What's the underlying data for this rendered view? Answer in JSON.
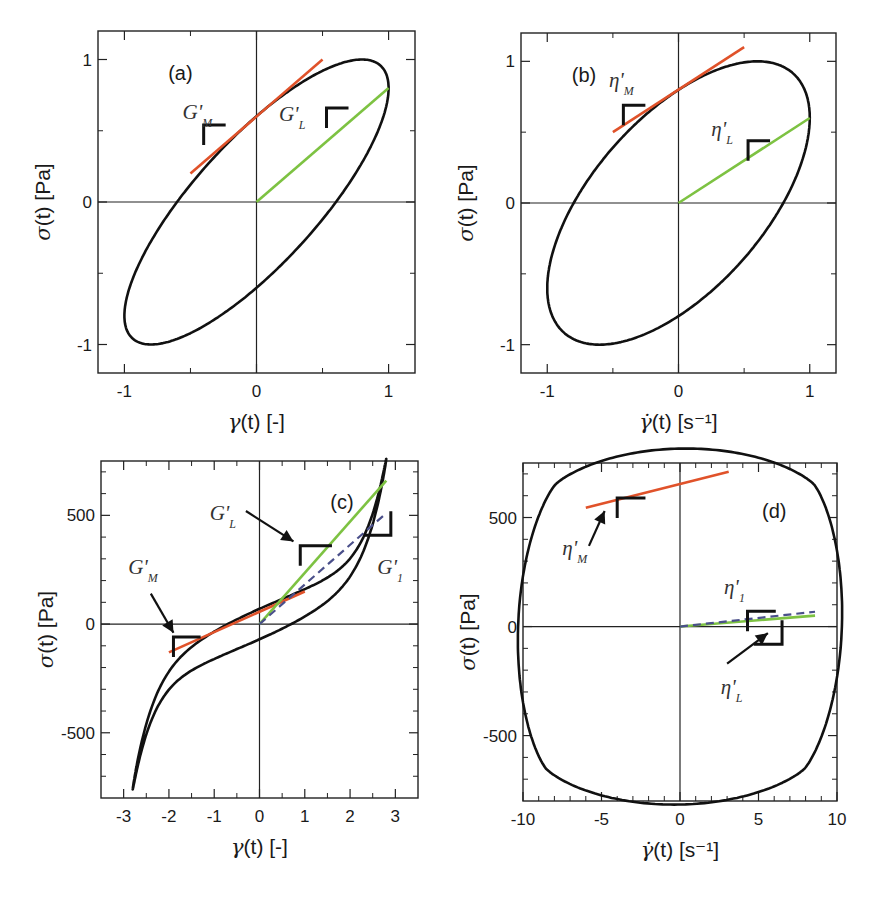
{
  "colors": {
    "curve": "#111111",
    "max_tangent": "#e0522a",
    "secant": "#7dc242",
    "dashed": "#4a4f8a",
    "axes": "#222222"
  },
  "chart_data": [
    {
      "id": "a",
      "type": "line",
      "panel_tag": "(a)",
      "title": "",
      "xlabel": {
        "symbol": "γ",
        "text": "(t)",
        "unit": "[-]"
      },
      "ylabel": {
        "symbol": "σ",
        "text": "(t)",
        "unit": "[Pa]"
      },
      "xlim": [
        -1.2,
        1.2
      ],
      "ylim": [
        -1.2,
        1.2
      ],
      "xticks_major": [
        -1,
        0,
        1
      ],
      "xticks_labels": [
        "-1",
        "0",
        "1"
      ],
      "xticks_minor": [
        -0.5,
        0.5
      ],
      "yticks_major": [
        -1,
        0,
        1
      ],
      "yticks_labels": [
        "-1",
        "0",
        "1"
      ],
      "yticks_minor": [
        -0.5,
        0.5
      ],
      "curve": {
        "shape": "ellipse",
        "strain_amplitude": 1.0,
        "stress_amplitude": 1.0,
        "phase_shift_deg": 37
      },
      "lines": [
        {
          "name": "G'_M tangent",
          "color_key": "max_tangent",
          "x": [
            -0.5,
            0.5
          ],
          "y": [
            0.2,
            1.0
          ]
        },
        {
          "name": "G'_L secant",
          "color_key": "secant",
          "x": [
            0,
            1.0
          ],
          "y": [
            0,
            0.8
          ]
        }
      ],
      "annotations": [
        {
          "main": "G'",
          "sub": "M",
          "x": -0.56,
          "y": 0.58
        },
        {
          "main": "G'",
          "sub": "L",
          "x": 0.17,
          "y": 0.57
        }
      ],
      "slope_markers": [
        {
          "x": -0.4,
          "y": 0.54
        },
        {
          "x": 0.53,
          "y": 0.66
        }
      ]
    },
    {
      "id": "b",
      "type": "line",
      "panel_tag": "(b)",
      "title": "",
      "xlabel": {
        "symbol": "γ̇",
        "text": "(t)",
        "unit": "[s⁻¹]"
      },
      "ylabel": {
        "symbol": "σ",
        "text": "(t)",
        "unit": "[Pa]"
      },
      "xlim": [
        -1.2,
        1.2
      ],
      "ylim": [
        -1.2,
        1.2
      ],
      "xticks_major": [
        -1,
        0,
        1
      ],
      "xticks_labels": [
        "-1",
        "0",
        "1"
      ],
      "xticks_minor": [
        -0.5,
        0.5
      ],
      "yticks_major": [
        -1,
        0,
        1
      ],
      "yticks_labels": [
        "-1",
        "0",
        "1"
      ],
      "yticks_minor": [
        -0.5,
        0.5
      ],
      "curve": {
        "shape": "ellipse",
        "rate_amplitude": 1.0,
        "stress_amplitude": 1.0,
        "phase_shift_deg": 53
      },
      "lines": [
        {
          "name": "η'_M tangent",
          "color_key": "max_tangent",
          "x": [
            -0.5,
            0.5
          ],
          "y": [
            0.5,
            1.1
          ]
        },
        {
          "name": "η'_L secant",
          "color_key": "secant",
          "x": [
            0,
            1.0
          ],
          "y": [
            0,
            0.6
          ]
        }
      ],
      "annotations": [
        {
          "main": "η'",
          "sub": "M",
          "x": -0.53,
          "y": 0.82
        },
        {
          "main": "η'",
          "sub": "L",
          "x": 0.25,
          "y": 0.47
        }
      ],
      "slope_markers": [
        {
          "x": -0.42,
          "y": 0.69
        },
        {
          "x": 0.53,
          "y": 0.44
        }
      ]
    },
    {
      "id": "c",
      "type": "line",
      "panel_tag": "(c)",
      "title": "",
      "xlabel": {
        "symbol": "γ",
        "text": "(t)",
        "unit": "[-]"
      },
      "ylabel": {
        "symbol": "σ",
        "text": "(t)",
        "unit": "[Pa]"
      },
      "xlim": [
        -3.5,
        3.5
      ],
      "ylim": [
        -800,
        750
      ],
      "xticks_major": [
        -3,
        -2,
        -1,
        0,
        1,
        2,
        3
      ],
      "xticks_labels": [
        "-3",
        "-2",
        "-1",
        "0",
        "1",
        "2",
        "3"
      ],
      "xticks_minor": [
        -2.5,
        -1.5,
        -0.5,
        0.5,
        1.5,
        2.5
      ],
      "yticks_major": [
        -500,
        0,
        500
      ],
      "yticks_labels": [
        "-500",
        "0",
        "500"
      ],
      "yticks_minor": [
        -700,
        -600,
        -400,
        -300,
        -200,
        -100,
        100,
        200,
        300,
        400,
        600,
        700
      ],
      "curve": {
        "shape": "strain-stiffening loop",
        "strain_amplitude": 2.8,
        "stress_max": 660,
        "stress_intercept_at_zero_strain": [
          -70,
          70
        ]
      },
      "lines": [
        {
          "name": "G'_M tangent",
          "color_key": "max_tangent",
          "x": [
            -2.0,
            1.0
          ],
          "y": [
            -130,
            150
          ]
        },
        {
          "name": "G'_L secant",
          "color_key": "secant",
          "x": [
            0,
            2.8
          ],
          "y": [
            0,
            660
          ]
        },
        {
          "name": "G'_1",
          "color_key": "dashed",
          "dashed": true,
          "x": [
            0,
            2.8
          ],
          "y": [
            0,
            510
          ]
        }
      ],
      "annotations": [
        {
          "main": "G'",
          "sub": "M",
          "x": -2.9,
          "y": 230
        },
        {
          "main": "G'",
          "sub": "L",
          "x": -1.1,
          "y": 480
        },
        {
          "main": "G'",
          "sub": "1",
          "x": 2.6,
          "y": 230
        }
      ],
      "slope_markers": [
        {
          "x": -1.9,
          "y": -60,
          "w": 0.6
        },
        {
          "x": 0.9,
          "y": 360,
          "w": 0.7
        },
        {
          "x": 2.9,
          "y": 500,
          "w": 0.6,
          "mirrored": true
        }
      ],
      "arrows": [
        {
          "from": [
            -2.4,
            140
          ],
          "to": [
            -1.9,
            -40
          ]
        },
        {
          "from": [
            -0.3,
            520
          ],
          "to": [
            0.75,
            380
          ]
        }
      ]
    },
    {
      "id": "d",
      "type": "line",
      "panel_tag": "(d)",
      "title": "",
      "xlabel": {
        "symbol": "γ̇",
        "text": "(t)",
        "unit": "[s⁻¹]"
      },
      "ylabel": {
        "symbol": "σ",
        "text": "(t)",
        "unit": "[Pa]"
      },
      "xlim": [
        -10,
        10
      ],
      "ylim": [
        -800,
        750
      ],
      "xticks_major": [
        -10,
        -5,
        0,
        5,
        10
      ],
      "xticks_labels": [
        "-10",
        "-5",
        "0",
        "5",
        "10"
      ],
      "xticks_minor": [
        -9,
        -8,
        -7,
        -6,
        -4,
        -3,
        -2,
        -1,
        1,
        2,
        3,
        4,
        6,
        7,
        8,
        9
      ],
      "yticks_major": [
        -500,
        0,
        500
      ],
      "yticks_labels": [
        "-500",
        "0",
        "500"
      ],
      "yticks_minor": [
        -700,
        -600,
        -400,
        -300,
        -200,
        -100,
        100,
        200,
        300,
        400,
        600,
        700
      ],
      "curve": {
        "shape": "rounded diamond loop",
        "rate_amplitude": 8.4,
        "stress_max": 665
      },
      "lines": [
        {
          "name": "η'_M tangent",
          "color_key": "max_tangent",
          "x": [
            -6.0,
            3.1
          ],
          "y": [
            545,
            710
          ]
        },
        {
          "name": "η'_L secant",
          "color_key": "secant",
          "x": [
            0,
            8.6
          ],
          "y": [
            0,
            50
          ]
        },
        {
          "name": "η'_1",
          "color_key": "dashed",
          "dashed": true,
          "x": [
            0,
            8.6
          ],
          "y": [
            0,
            68
          ]
        }
      ],
      "annotations": [
        {
          "main": "η'",
          "sub": "M",
          "x": -7.5,
          "y": 330
        },
        {
          "main": "η'",
          "sub": "1",
          "x": 2.8,
          "y": 150
        },
        {
          "main": "η'",
          "sub": "L",
          "x": 2.6,
          "y": -310
        }
      ],
      "slope_markers": [
        {
          "x": -4.0,
          "y": 590,
          "w": 1.8
        },
        {
          "x": 4.3,
          "y": 70,
          "w": 1.8
        },
        {
          "x": 6.5,
          "y": 10,
          "w": 1.8,
          "mirrored": true
        }
      ],
      "arrows": [
        {
          "from": [
            -5.8,
            370
          ],
          "to": [
            -4.8,
            530
          ]
        },
        {
          "from": [
            3.0,
            -170
          ],
          "to": [
            5.6,
            -30
          ]
        }
      ]
    }
  ]
}
